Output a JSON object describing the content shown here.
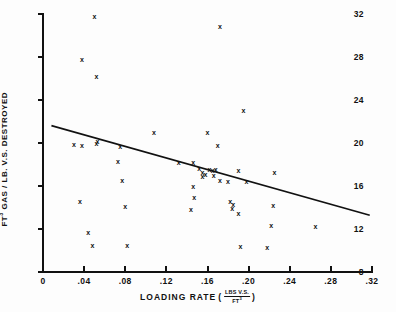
{
  "chart_data": {
    "type": "scatter",
    "title": "",
    "xlabel": "LOADING RATE",
    "xlabel_units_numerator": "LBS V.S.",
    "xlabel_units_denominator": "FT3",
    "ylabel": "FT3 GAS / LB. V.S. DESTROYED",
    "xlim": [
      0,
      0.32
    ],
    "ylim": [
      8,
      32
    ],
    "xticks": [
      0,
      0.04,
      0.08,
      0.12,
      0.16,
      0.2,
      0.24,
      0.28,
      0.32
    ],
    "xticklabels": [
      "0",
      ".04",
      ".08",
      ".12",
      ".16",
      ".20",
      ".24",
      ".28",
      ".32"
    ],
    "yticks": [
      8,
      12,
      16,
      20,
      24,
      28,
      32
    ],
    "yticklabels": [
      "8",
      "12",
      "16",
      "20",
      "24",
      "28",
      "32"
    ],
    "grid": false,
    "legend": false,
    "marker": "x",
    "marker_color": "#111111",
    "line_color": "#111111",
    "points": [
      {
        "x": 0.038,
        "y": 27.8
      },
      {
        "x": 0.05,
        "y": 31.8
      },
      {
        "x": 0.052,
        "y": 26.2
      },
      {
        "x": 0.03,
        "y": 19.9
      },
      {
        "x": 0.038,
        "y": 19.8
      },
      {
        "x": 0.052,
        "y": 20.0
      },
      {
        "x": 0.053,
        "y": 20.1
      },
      {
        "x": 0.036,
        "y": 14.6
      },
      {
        "x": 0.044,
        "y": 11.7
      },
      {
        "x": 0.048,
        "y": 10.5
      },
      {
        "x": 0.075,
        "y": 19.7
      },
      {
        "x": 0.073,
        "y": 18.3
      },
      {
        "x": 0.077,
        "y": 16.5
      },
      {
        "x": 0.08,
        "y": 14.1
      },
      {
        "x": 0.082,
        "y": 10.5
      },
      {
        "x": 0.108,
        "y": 21.0
      },
      {
        "x": 0.132,
        "y": 18.2
      },
      {
        "x": 0.146,
        "y": 18.2
      },
      {
        "x": 0.146,
        "y": 16.0
      },
      {
        "x": 0.147,
        "y": 14.9
      },
      {
        "x": 0.144,
        "y": 13.8
      },
      {
        "x": 0.16,
        "y": 21.0
      },
      {
        "x": 0.152,
        "y": 17.6
      },
      {
        "x": 0.155,
        "y": 17.3
      },
      {
        "x": 0.158,
        "y": 17.1
      },
      {
        "x": 0.155,
        "y": 16.9
      },
      {
        "x": 0.162,
        "y": 17.5
      },
      {
        "x": 0.165,
        "y": 17.4
      },
      {
        "x": 0.168,
        "y": 17.5
      },
      {
        "x": 0.166,
        "y": 17.0
      },
      {
        "x": 0.17,
        "y": 19.8
      },
      {
        "x": 0.172,
        "y": 30.8
      },
      {
        "x": 0.172,
        "y": 16.5
      },
      {
        "x": 0.18,
        "y": 16.4
      },
      {
        "x": 0.182,
        "y": 14.6
      },
      {
        "x": 0.185,
        "y": 14.3
      },
      {
        "x": 0.184,
        "y": 13.9
      },
      {
        "x": 0.19,
        "y": 13.4
      },
      {
        "x": 0.192,
        "y": 10.4
      },
      {
        "x": 0.19,
        "y": 17.4
      },
      {
        "x": 0.198,
        "y": 16.4
      },
      {
        "x": 0.225,
        "y": 17.3
      },
      {
        "x": 0.224,
        "y": 14.2
      },
      {
        "x": 0.222,
        "y": 12.3
      },
      {
        "x": 0.218,
        "y": 10.3
      },
      {
        "x": 0.265,
        "y": 12.2
      },
      {
        "x": 0.195,
        "y": 23.0
      }
    ],
    "trendline": {
      "x": [
        0.009,
        0.317
      ],
      "y": [
        21.6,
        13.3
      ]
    }
  }
}
